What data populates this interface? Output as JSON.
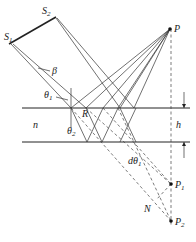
{
  "diagram": {
    "type": "optics-thin-film-interference",
    "labels": {
      "s1": "S",
      "s1_sub": "1",
      "s2": "S",
      "s2_sub": "2",
      "p": "P",
      "p1": "P",
      "p1_sub": "1",
      "p2": "P",
      "p2_sub": "2",
      "n": "n",
      "h": "h",
      "beta": "β",
      "theta1": "θ",
      "theta1_sub": "1",
      "theta2": "θ",
      "theta2_sub": "2",
      "r": "R",
      "dtheta": "dθ",
      "dtheta_sub": "1",
      "N": "N"
    },
    "colors": {
      "line": "#333333",
      "background": "#ffffff"
    }
  }
}
